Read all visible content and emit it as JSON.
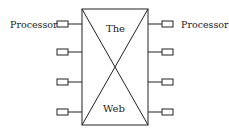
{
  "diagram": {
    "center_label_top": "The",
    "center_label_bottom": "Web",
    "left_label": "Processor",
    "right_label": "Processor",
    "left_processor_count": 4,
    "right_processor_count": 4,
    "stroke_color": "#222222",
    "background_color": "#ffffff"
  }
}
